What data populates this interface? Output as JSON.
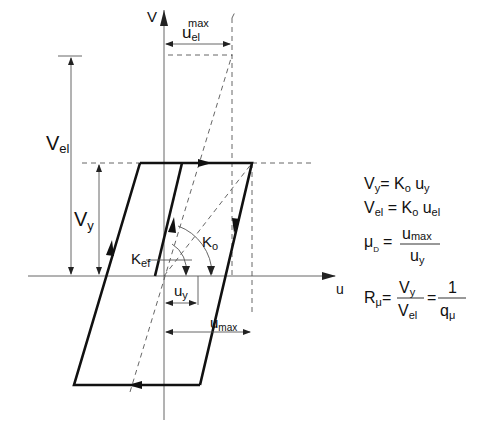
{
  "diagram": {
    "axes": {
      "x_label": "u",
      "y_label": "V"
    },
    "labels": {
      "u_el_max": "u",
      "u_el_max_sub": "el",
      "u_el_max_sup": "max",
      "V_el": "V",
      "V_el_sub": "el",
      "V_y": "V",
      "V_y_sub": "y",
      "K_ef": "K",
      "K_ef_sub": "ef",
      "K_o": "K",
      "K_o_sub": "o",
      "u_y": "u",
      "u_y_sub": "y",
      "u_max": "u",
      "u_max_sub": "max"
    },
    "equations": [
      {
        "lhs": "V",
        "lhs_sub": "y",
        "rhs": "= K",
        "rhs_sub": "o",
        "rhs2": " u",
        "rhs2_sub": "y"
      },
      {
        "lhs": "V",
        "lhs_sub": "el",
        "rhs": " = K",
        "rhs_sub": "o",
        "rhs2": " u",
        "rhs2_sub": "el"
      },
      {
        "lhs": "μ",
        "lhs_sub": "D",
        "eq": "=",
        "num": "u",
        "num_sub": "max",
        "den": "u",
        "den_sub": "y"
      },
      {
        "lhs": "R",
        "lhs_sub": "μ",
        "eq": "=",
        "num1": "V",
        "num1_sub": "y",
        "den1": "V",
        "den1_sub": "el",
        "eq2": "=",
        "num2": "1",
        "den2": "q",
        "den2_sub": "μ"
      }
    ],
    "colors": {
      "loop": "#111111",
      "guides": "#555555",
      "background": "#ffffff"
    }
  }
}
